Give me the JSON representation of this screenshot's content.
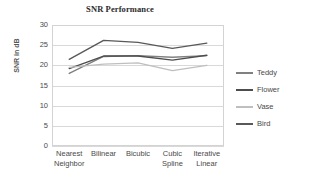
{
  "chart_data": {
    "type": "line",
    "title": "SNR Performance",
    "xlabel": "",
    "ylabel": "SNR in dB",
    "categories": [
      "Nearest Neighbor",
      "Bilinear",
      "Bicubic",
      "Cubic Spline",
      "Iterative Linear"
    ],
    "category_lines": [
      [
        "Nearest",
        "Neighbor"
      ],
      [
        "Bilinear",
        ""
      ],
      [
        "Bicubic",
        ""
      ],
      [
        "Cubic",
        "Spline"
      ],
      [
        "Iterative",
        "Linear"
      ]
    ],
    "ylim": [
      0,
      30
    ],
    "yticks": [
      0,
      5,
      10,
      15,
      20,
      25,
      30
    ],
    "ytick_labels": [
      "0",
      "5",
      "10",
      "15",
      "20",
      "25",
      "30"
    ],
    "grid": true,
    "legend_position": "right",
    "series": [
      {
        "name": "Teddy",
        "color": "#808080",
        "values": [
          18.0,
          22.2,
          22.4,
          22.0,
          22.4
        ]
      },
      {
        "name": "Flower",
        "color": "#4d4d4d",
        "values": [
          19.2,
          22.3,
          22.3,
          21.3,
          22.5
        ]
      },
      {
        "name": "Vase",
        "color": "#bfbfbf",
        "values": [
          19.5,
          20.3,
          20.6,
          18.7,
          20.0
        ]
      },
      {
        "name": "Bird",
        "color": "#595959",
        "values": [
          21.5,
          26.2,
          25.7,
          24.2,
          25.5
        ]
      }
    ]
  },
  "legend": {
    "items": [
      {
        "label": "Teddy"
      },
      {
        "label": "Flower"
      },
      {
        "label": "Vase"
      },
      {
        "label": "Bird"
      }
    ]
  },
  "colors": {
    "background": "#ffffff",
    "gridline": "#d9d9d9",
    "border": "#d3d3d3",
    "text": "#4a4a4a",
    "title": "#2b2b2b"
  }
}
